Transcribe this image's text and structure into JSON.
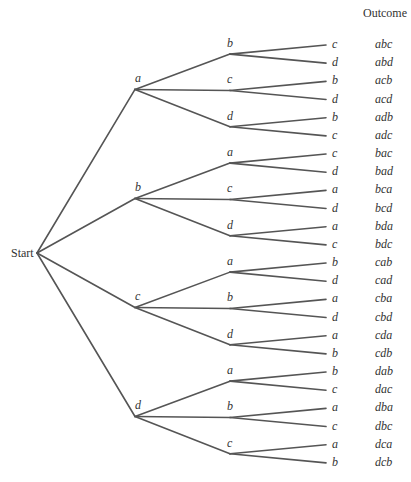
{
  "header": {
    "outcome_label": "Outcome"
  },
  "root": {
    "label": "Start",
    "x": 37,
    "y": 253
  },
  "style": {
    "line_color": "#555555",
    "text_color": "#333333"
  },
  "geometry": {
    "level1_x": 135,
    "level2_x": 230,
    "leaf_line_x": 326,
    "leaf_label_x": 332,
    "outcome_x": 375,
    "first_leaf_y": 45,
    "leaf_spacing": 18.17
  },
  "tree": [
    {
      "label": "a",
      "children": [
        {
          "label": "b",
          "leaves": [
            {
              "label": "c",
              "outcome": "abc"
            },
            {
              "label": "d",
              "outcome": "abd"
            }
          ]
        },
        {
          "label": "c",
          "leaves": [
            {
              "label": "b",
              "outcome": "acb"
            },
            {
              "label": "d",
              "outcome": "acd"
            }
          ]
        },
        {
          "label": "d",
          "leaves": [
            {
              "label": "b",
              "outcome": "adb"
            },
            {
              "label": "c",
              "outcome": "adc"
            }
          ]
        }
      ]
    },
    {
      "label": "b",
      "children": [
        {
          "label": "a",
          "leaves": [
            {
              "label": "c",
              "outcome": "bac"
            },
            {
              "label": "d",
              "outcome": "bad"
            }
          ]
        },
        {
          "label": "c",
          "leaves": [
            {
              "label": "a",
              "outcome": "bca"
            },
            {
              "label": "d",
              "outcome": "bcd"
            }
          ]
        },
        {
          "label": "d",
          "leaves": [
            {
              "label": "a",
              "outcome": "bda"
            },
            {
              "label": "c",
              "outcome": "bdc"
            }
          ]
        }
      ]
    },
    {
      "label": "c",
      "children": [
        {
          "label": "a",
          "leaves": [
            {
              "label": "b",
              "outcome": "cab"
            },
            {
              "label": "d",
              "outcome": "cad"
            }
          ]
        },
        {
          "label": "b",
          "leaves": [
            {
              "label": "a",
              "outcome": "cba"
            },
            {
              "label": "d",
              "outcome": "cbd"
            }
          ]
        },
        {
          "label": "d",
          "leaves": [
            {
              "label": "a",
              "outcome": "cda"
            },
            {
              "label": "b",
              "outcome": "cdb"
            }
          ]
        }
      ]
    },
    {
      "label": "d",
      "children": [
        {
          "label": "a",
          "leaves": [
            {
              "label": "b",
              "outcome": "dab"
            },
            {
              "label": "c",
              "outcome": "dac"
            }
          ]
        },
        {
          "label": "b",
          "leaves": [
            {
              "label": "a",
              "outcome": "dba"
            },
            {
              "label": "c",
              "outcome": "dbc"
            }
          ]
        },
        {
          "label": "c",
          "leaves": [
            {
              "label": "a",
              "outcome": "dca"
            },
            {
              "label": "b",
              "outcome": "dcb"
            }
          ]
        }
      ]
    }
  ]
}
